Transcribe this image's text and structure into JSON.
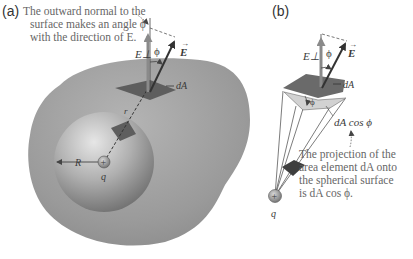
{
  "panel_a": {
    "label": "(a)",
    "caption_lines": [
      "The outward normal to the",
      "surface makes an angle ϕ",
      "with the direction of E."
    ],
    "labels": {
      "E_perp": "E⊥",
      "phi": "ϕ",
      "E": "E",
      "dA": "dA",
      "R": "R",
      "r": "r",
      "q": "q",
      "charge_sign": "+"
    }
  },
  "panel_b": {
    "label": "(b)",
    "labels": {
      "E_perp": "E⊥",
      "phi": "ϕ",
      "phi_lower": "ϕ",
      "E": "E",
      "dA": "dA",
      "dA_cos_phi": "dA cos ϕ",
      "q": "q",
      "charge_sign": "+"
    },
    "caption_lines": [
      "The projection of the",
      "area element dA onto",
      "the spherical surface",
      "is dA cos ϕ."
    ]
  },
  "colors": {
    "outer_surface": "#9a9a9a",
    "sphere_light": "#d6d6d6",
    "sphere_dark": "#7a7a7a",
    "patch": "#5e5e5e",
    "vector": "#333333",
    "perp_vector": "#8a8a8a",
    "caption": "#666666"
  }
}
